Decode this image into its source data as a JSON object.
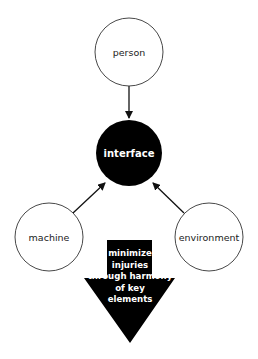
{
  "diagram": {
    "nodes": {
      "person": {
        "label": "person"
      },
      "interface": {
        "label": "interface"
      },
      "machine": {
        "label": "machine"
      },
      "environment": {
        "label": "environment"
      }
    },
    "edges": [
      {
        "from": "person",
        "to": "interface"
      },
      {
        "from": "machine",
        "to": "interface"
      },
      {
        "from": "environment",
        "to": "interface"
      }
    ],
    "outcome_arrow": {
      "lines": [
        "minimize",
        "injuries",
        "through harmony",
        "of key",
        "elements"
      ]
    },
    "colors": {
      "node_fill": "#ffffff",
      "node_stroke": "#333333",
      "center_fill": "#000000",
      "arrow_fill": "#000000"
    }
  }
}
